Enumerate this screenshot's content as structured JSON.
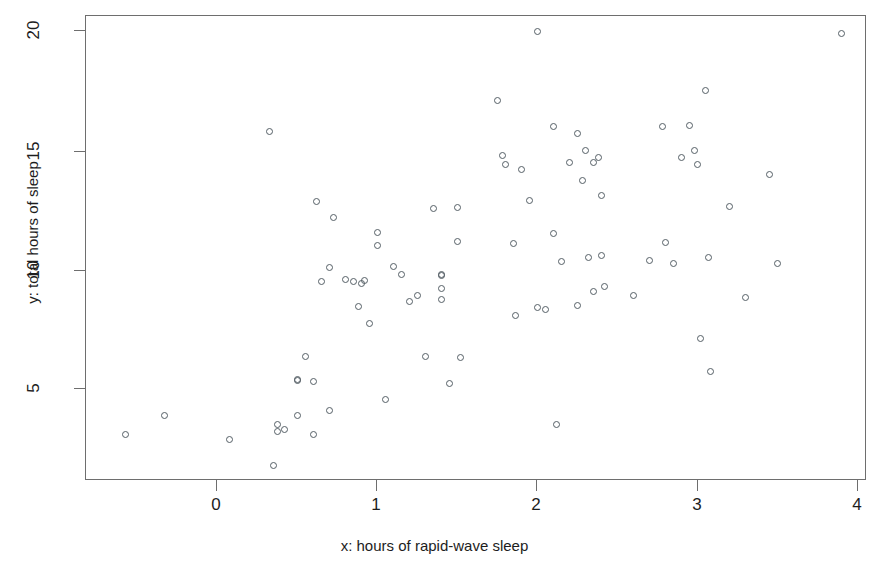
{
  "chart_data": {
    "type": "scatter",
    "title": "",
    "xlabel": "x: hours of rapid-wave sleep",
    "ylabel": "y: total hours of sleep",
    "xlim": [
      -0.75,
      4.05
    ],
    "ylim": [
      1.4,
      20.4
    ],
    "xticks": [
      0,
      1,
      2,
      3,
      4
    ],
    "xtick_labels": [
      "0",
      "1",
      "2",
      "3",
      "4"
    ],
    "yticks": [
      5,
      10,
      15,
      20
    ],
    "ytick_labels": [
      "5",
      "10",
      "15",
      "20"
    ],
    "grid": false,
    "legend": null,
    "marker": "open-circle",
    "marker_color": "#555f66",
    "point_count": 102,
    "points": [
      [
        -0.57,
        3.1
      ],
      [
        -0.33,
        3.9
      ],
      [
        0.08,
        2.9
      ],
      [
        0.33,
        15.8
      ],
      [
        0.35,
        1.8
      ],
      [
        0.38,
        3.5
      ],
      [
        0.38,
        3.2
      ],
      [
        0.42,
        3.3
      ],
      [
        0.5,
        5.4
      ],
      [
        0.5,
        5.35
      ],
      [
        0.5,
        3.9
      ],
      [
        0.55,
        6.35
      ],
      [
        0.6,
        5.3
      ],
      [
        0.6,
        3.1
      ],
      [
        0.62,
        12.85
      ],
      [
        0.65,
        9.5
      ],
      [
        0.7,
        10.1
      ],
      [
        0.7,
        4.1
      ],
      [
        0.73,
        12.2
      ],
      [
        0.8,
        9.6
      ],
      [
        0.85,
        9.5
      ],
      [
        0.88,
        8.45
      ],
      [
        0.9,
        9.4
      ],
      [
        0.92,
        9.55
      ],
      [
        0.95,
        7.75
      ],
      [
        1.0,
        11.55
      ],
      [
        1.0,
        11.0
      ],
      [
        1.05,
        4.55
      ],
      [
        1.1,
        10.15
      ],
      [
        1.15,
        9.8
      ],
      [
        1.2,
        8.65
      ],
      [
        1.25,
        8.9
      ],
      [
        1.3,
        6.35
      ],
      [
        1.35,
        12.55
      ],
      [
        1.4,
        9.8
      ],
      [
        1.4,
        9.75
      ],
      [
        1.4,
        9.2
      ],
      [
        1.4,
        8.75
      ],
      [
        1.45,
        5.25
      ],
      [
        1.5,
        12.6
      ],
      [
        1.5,
        11.2
      ],
      [
        1.52,
        6.3
      ],
      [
        1.75,
        17.1
      ],
      [
        1.78,
        14.8
      ],
      [
        1.8,
        14.4
      ],
      [
        1.85,
        11.1
      ],
      [
        1.86,
        8.1
      ],
      [
        1.9,
        14.2
      ],
      [
        1.95,
        12.9
      ],
      [
        2.0,
        20.0
      ],
      [
        2.0,
        8.4
      ],
      [
        2.05,
        8.35
      ],
      [
        2.1,
        11.5
      ],
      [
        2.1,
        16.0
      ],
      [
        2.12,
        3.5
      ],
      [
        2.15,
        10.35
      ],
      [
        2.2,
        14.5
      ],
      [
        2.25,
        15.7
      ],
      [
        2.25,
        8.5
      ],
      [
        2.28,
        13.75
      ],
      [
        2.3,
        15.0
      ],
      [
        2.32,
        10.5
      ],
      [
        2.35,
        14.5
      ],
      [
        2.35,
        9.1
      ],
      [
        2.38,
        14.7
      ],
      [
        2.4,
        13.1
      ],
      [
        2.4,
        10.6
      ],
      [
        2.42,
        9.3
      ],
      [
        2.6,
        8.9
      ],
      [
        2.7,
        10.4
      ],
      [
        2.78,
        16.0
      ],
      [
        2.8,
        11.15
      ],
      [
        2.85,
        10.25
      ],
      [
        2.9,
        14.7
      ],
      [
        2.95,
        16.05
      ],
      [
        2.98,
        15.0
      ],
      [
        3.0,
        14.4
      ],
      [
        3.02,
        7.1
      ],
      [
        3.05,
        17.5
      ],
      [
        3.07,
        10.5
      ],
      [
        3.08,
        5.75
      ],
      [
        3.2,
        12.65
      ],
      [
        3.3,
        8.85
      ],
      [
        3.45,
        14.0
      ],
      [
        3.5,
        10.25
      ],
      [
        3.9,
        19.9
      ]
    ]
  },
  "axes": {
    "y_title": "y: total hours of sleep",
    "x_title": "x: hours of rapid-wave sleep"
  }
}
